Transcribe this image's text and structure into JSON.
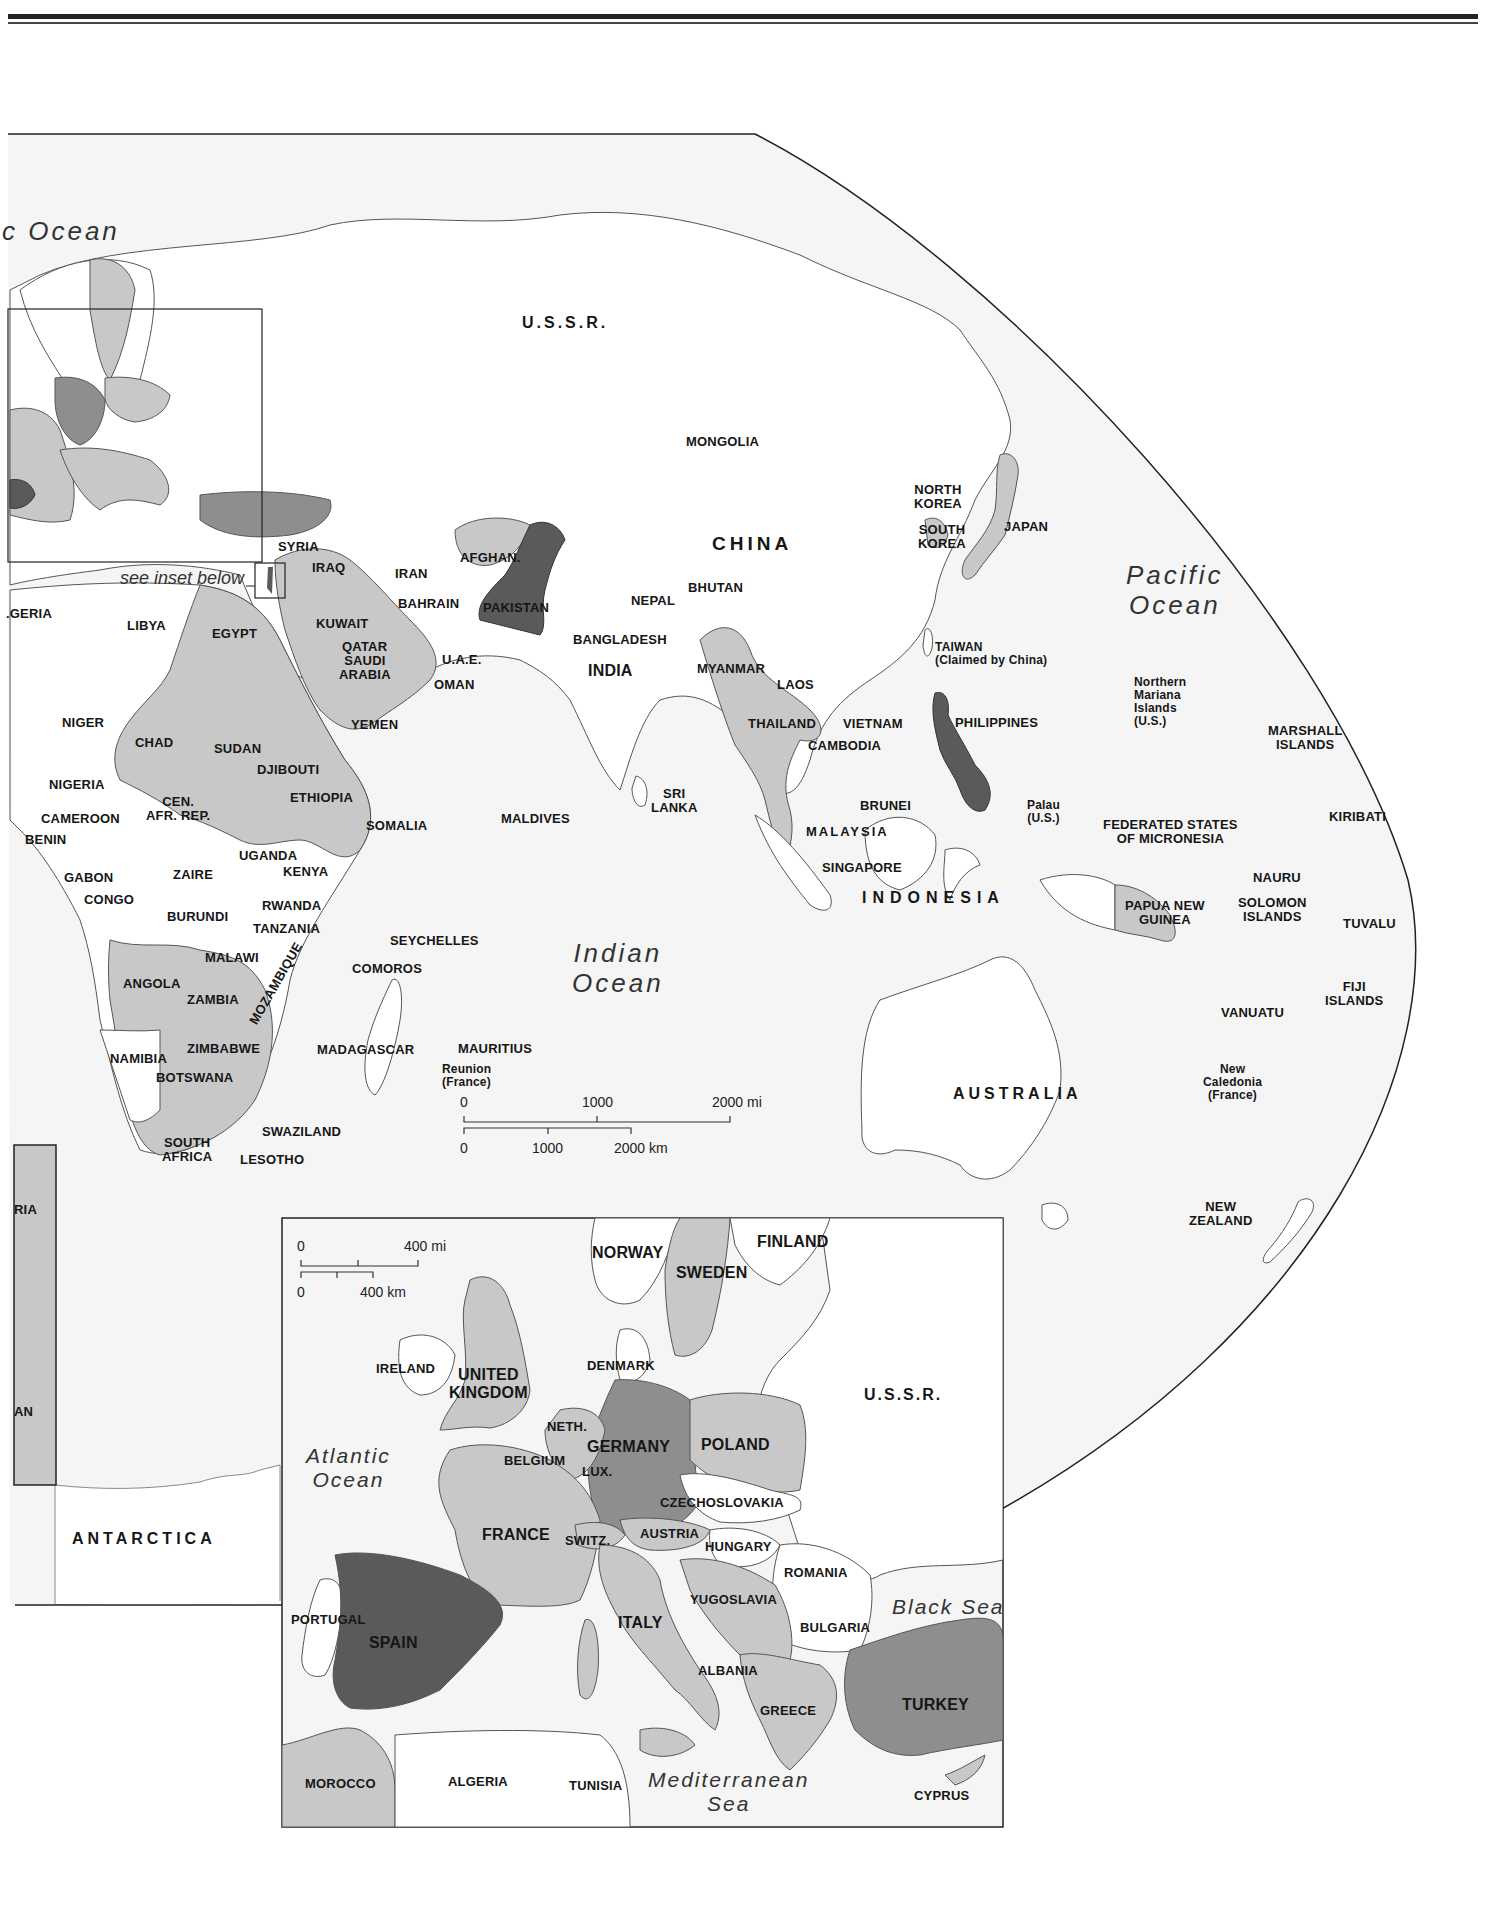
{
  "colors": {
    "ocean": "#f5f5f5",
    "land_none": "#ffffff",
    "land_light": "#c8c8c8",
    "land_medium": "#8e8e8e",
    "land_dark": "#5a5a5a",
    "border": "#555555",
    "frame": "#222222"
  },
  "main_map": {
    "oceans": [
      {
        "id": "arctic",
        "text": "c Ocean",
        "x": 2,
        "y": 216,
        "cls": "ocean"
      },
      {
        "id": "pacific",
        "text": "Pacific\nOcean",
        "x": 1126,
        "y": 560,
        "cls": "ocean"
      },
      {
        "id": "indian",
        "text": "Indian\nOcean",
        "x": 572,
        "y": 938,
        "cls": "ocean"
      }
    ],
    "annotations": [
      {
        "id": "see-inset",
        "text": "see inset below",
        "x": 120,
        "y": 578
      }
    ],
    "labels": [
      {
        "text": "U.S.S.R.",
        "x": 522,
        "y": 314,
        "cls": "med",
        "ls": 3
      },
      {
        "text": "MONGOLIA",
        "x": 686,
        "y": 435
      },
      {
        "text": "CHINA",
        "x": 712,
        "y": 534,
        "cls": "big"
      },
      {
        "text": "NORTH\nKOREA",
        "x": 914,
        "y": 483
      },
      {
        "text": "SOUTH\nKOREA",
        "x": 918,
        "y": 523
      },
      {
        "text": "JAPAN",
        "x": 1004,
        "y": 520
      },
      {
        "text": "SYRIA",
        "x": 278,
        "y": 540
      },
      {
        "text": "IRAQ",
        "x": 312,
        "y": 561
      },
      {
        "text": "IRAN",
        "x": 395,
        "y": 567
      },
      {
        "text": "AFGHAN.",
        "x": 460,
        "y": 551
      },
      {
        "text": "PAKISTAN",
        "x": 483,
        "y": 601
      },
      {
        "text": "BAHRAIN",
        "x": 398,
        "y": 597
      },
      {
        "text": "KUWAIT",
        "x": 316,
        "y": 617
      },
      {
        "text": "QATAR",
        "x": 342,
        "y": 640
      },
      {
        "text": "SAUDI\nARABIA",
        "x": 339,
        "y": 654
      },
      {
        "text": "U.A.E.",
        "x": 442,
        "y": 653
      },
      {
        "text": "OMAN",
        "x": 434,
        "y": 678
      },
      {
        "text": "YEMEN",
        "x": 351,
        "y": 718
      },
      {
        "text": "NEPAL",
        "x": 631,
        "y": 594
      },
      {
        "text": "BHUTAN",
        "x": 688,
        "y": 581
      },
      {
        "text": "BANGLADESH",
        "x": 573,
        "y": 633
      },
      {
        "text": "INDIA",
        "x": 588,
        "y": 662,
        "cls": "med"
      },
      {
        "text": "MYANMAR",
        "x": 697,
        "y": 662
      },
      {
        "text": "LAOS",
        "x": 777,
        "y": 678
      },
      {
        "text": "THAILAND",
        "x": 748,
        "y": 717
      },
      {
        "text": "VIETNAM",
        "x": 843,
        "y": 717
      },
      {
        "text": "CAMBODIA",
        "x": 808,
        "y": 739
      },
      {
        "text": "TAIWAN\n(Claimed by China)",
        "x": 935,
        "y": 641,
        "cls": "small left"
      },
      {
        "text": "PHILIPPINES",
        "x": 955,
        "y": 716
      },
      {
        "text": "Northern\nMariana\nIslands\n(U.S.)",
        "x": 1134,
        "y": 676,
        "cls": "small left"
      },
      {
        "text": "MARSHALL\nISLANDS",
        "x": 1268,
        "y": 724
      },
      {
        "text": "SRI\nLANKA",
        "x": 651,
        "y": 787
      },
      {
        "text": "MALDIVES",
        "x": 501,
        "y": 812
      },
      {
        "text": "BRUNEI",
        "x": 860,
        "y": 799
      },
      {
        "text": "MALAYSIA",
        "x": 806,
        "y": 825,
        "ls": 2
      },
      {
        "text": "SINGAPORE",
        "x": 822,
        "y": 861
      },
      {
        "text": "INDONESIA",
        "x": 862,
        "y": 889,
        "cls": "med",
        "ls": 6
      },
      {
        "text": "Palau\n(U.S.)",
        "x": 1027,
        "y": 799,
        "cls": "small"
      },
      {
        "text": "FEDERATED STATES\nOF MICRONESIA",
        "x": 1103,
        "y": 818
      },
      {
        "text": "KIRIBATI",
        "x": 1329,
        "y": 810
      },
      {
        "text": "NAURU",
        "x": 1253,
        "y": 871
      },
      {
        "text": "PAPUA NEW\nGUINEA",
        "x": 1125,
        "y": 899
      },
      {
        "text": "SOLOMON\nISLANDS",
        "x": 1238,
        "y": 896
      },
      {
        "text": "TUVALU",
        "x": 1343,
        "y": 917
      },
      {
        "text": "FIJI\nISLANDS",
        "x": 1325,
        "y": 980
      },
      {
        "text": "VANUATU",
        "x": 1221,
        "y": 1006
      },
      {
        "text": "New\nCaledonia\n(France)",
        "x": 1203,
        "y": 1063,
        "cls": "small"
      },
      {
        "text": "AUSTRALIA",
        "x": 953,
        "y": 1085,
        "cls": "med",
        "ls": 4
      },
      {
        "text": "NEW\nZEALAND",
        "x": 1189,
        "y": 1200
      },
      {
        "text": ".GERIA",
        "x": 6,
        "y": 607
      },
      {
        "text": "LIBYA",
        "x": 127,
        "y": 619
      },
      {
        "text": "EGYPT",
        "x": 212,
        "y": 627
      },
      {
        "text": "NIGER",
        "x": 62,
        "y": 716
      },
      {
        "text": "CHAD",
        "x": 135,
        "y": 736
      },
      {
        "text": "SUDAN",
        "x": 214,
        "y": 742
      },
      {
        "text": "DJIBOUTI",
        "x": 257,
        "y": 763
      },
      {
        "text": "NIGERIA",
        "x": 49,
        "y": 778
      },
      {
        "text": "ETHIOPIA",
        "x": 290,
        "y": 791
      },
      {
        "text": "CEN.\nAFR. REP.",
        "x": 146,
        "y": 795
      },
      {
        "text": "CAMEROON",
        "x": 41,
        "y": 812
      },
      {
        "text": "SOMALIA",
        "x": 366,
        "y": 819
      },
      {
        "text": "BENIN",
        "x": 25,
        "y": 833
      },
      {
        "text": "UGANDA",
        "x": 239,
        "y": 849
      },
      {
        "text": "KENYA",
        "x": 283,
        "y": 865
      },
      {
        "text": "GABON",
        "x": 64,
        "y": 871
      },
      {
        "text": "ZAIRE",
        "x": 173,
        "y": 868
      },
      {
        "text": "CONGO",
        "x": 84,
        "y": 893
      },
      {
        "text": "RWANDA",
        "x": 262,
        "y": 899
      },
      {
        "text": "BURUNDI",
        "x": 167,
        "y": 910
      },
      {
        "text": "TANZANIA",
        "x": 253,
        "y": 922
      },
      {
        "text": "SEYCHELLES",
        "x": 390,
        "y": 934
      },
      {
        "text": "MALAWI",
        "x": 205,
        "y": 951
      },
      {
        "text": "COMOROS",
        "x": 352,
        "y": 962
      },
      {
        "text": "ANGOLA",
        "x": 123,
        "y": 977
      },
      {
        "text": "ZAMBIA",
        "x": 187,
        "y": 993
      },
      {
        "text": "MOZAMBIQUE",
        "x": 247,
        "y": 1020,
        "rot": -60
      },
      {
        "text": "ZIMBABWE",
        "x": 187,
        "y": 1042
      },
      {
        "text": "MADAGASCAR",
        "x": 317,
        "y": 1043
      },
      {
        "text": "MAURITIUS",
        "x": 458,
        "y": 1042
      },
      {
        "text": "Reunion\n(France)",
        "x": 442,
        "y": 1063,
        "cls": "small left"
      },
      {
        "text": "NAMIBIA",
        "x": 110,
        "y": 1052
      },
      {
        "text": "BOTSWANA",
        "x": 156,
        "y": 1071
      },
      {
        "text": "SWAZILAND",
        "x": 262,
        "y": 1125
      },
      {
        "text": "SOUTH\nAFRICA",
        "x": 162,
        "y": 1136
      },
      {
        "text": "LESOTHO",
        "x": 240,
        "y": 1153
      },
      {
        "text": "RIA",
        "x": 14,
        "y": 1203
      },
      {
        "text": "AN",
        "x": 14,
        "y": 1405
      },
      {
        "text": "ANTARCTICA",
        "x": 72,
        "y": 1530,
        "cls": "med",
        "ls": 4
      }
    ],
    "scale_bar": {
      "miles": {
        "ticks": [
          "0",
          "1000",
          "2000 mi"
        ]
      },
      "km": {
        "ticks": [
          "0",
          "1000",
          "2000 km"
        ]
      }
    }
  },
  "europe_inset": {
    "oceans": [
      {
        "id": "atlantic",
        "text": "Atlantic\nOcean",
        "x": 306,
        "y": 1444,
        "cls": "ocean sm"
      },
      {
        "id": "mediterranean",
        "text": "Mediterranean\nSea",
        "x": 648,
        "y": 1768,
        "cls": "ocean sm"
      },
      {
        "id": "black-sea",
        "text": "Black Sea",
        "x": 892,
        "y": 1595,
        "cls": "ocean sm"
      }
    ],
    "labels": [
      {
        "text": "NORWAY",
        "x": 592,
        "y": 1244,
        "cls": "med"
      },
      {
        "text": "FINLAND",
        "x": 757,
        "y": 1233,
        "cls": "med"
      },
      {
        "text": "SWEDEN",
        "x": 676,
        "y": 1264,
        "cls": "med"
      },
      {
        "text": "IRELAND",
        "x": 376,
        "y": 1362
      },
      {
        "text": "UNITED\nKINGDOM",
        "x": 449,
        "y": 1366,
        "cls": "med"
      },
      {
        "text": "DENMARK",
        "x": 587,
        "y": 1359
      },
      {
        "text": "U.S.S.R.",
        "x": 864,
        "y": 1386,
        "cls": "med",
        "ls": 2
      },
      {
        "text": "NETH.",
        "x": 547,
        "y": 1420
      },
      {
        "text": "GERMANY",
        "x": 587,
        "y": 1438,
        "cls": "med"
      },
      {
        "text": "POLAND",
        "x": 701,
        "y": 1436,
        "cls": "med"
      },
      {
        "text": "BELGIUM",
        "x": 504,
        "y": 1454
      },
      {
        "text": "LUX.",
        "x": 582,
        "y": 1465
      },
      {
        "text": "CZECHOSLOVAKIA",
        "x": 660,
        "y": 1496
      },
      {
        "text": "FRANCE",
        "x": 482,
        "y": 1526,
        "cls": "med"
      },
      {
        "text": "SWITZ.",
        "x": 565,
        "y": 1534
      },
      {
        "text": "AUSTRIA",
        "x": 640,
        "y": 1527
      },
      {
        "text": "HUNGARY",
        "x": 705,
        "y": 1540
      },
      {
        "text": "ROMANIA",
        "x": 784,
        "y": 1566
      },
      {
        "text": "PORTUGAL",
        "x": 291,
        "y": 1613
      },
      {
        "text": "SPAIN",
        "x": 369,
        "y": 1634,
        "cls": "med"
      },
      {
        "text": "YUGOSLAVIA",
        "x": 690,
        "y": 1593
      },
      {
        "text": "ITALY",
        "x": 618,
        "y": 1614,
        "cls": "med"
      },
      {
        "text": "BULGARIA",
        "x": 800,
        "y": 1621
      },
      {
        "text": "ALBANIA",
        "x": 698,
        "y": 1664
      },
      {
        "text": "TURKEY",
        "x": 902,
        "y": 1696,
        "cls": "med"
      },
      {
        "text": "GREECE",
        "x": 760,
        "y": 1704
      },
      {
        "text": "MOROCCO",
        "x": 305,
        "y": 1777
      },
      {
        "text": "ALGERIA",
        "x": 448,
        "y": 1775
      },
      {
        "text": "TUNISIA",
        "x": 569,
        "y": 1779
      },
      {
        "text": "CYPRUS",
        "x": 914,
        "y": 1789
      }
    ],
    "scale_bar": {
      "miles": {
        "ticks": [
          "0",
          "400 mi"
        ]
      },
      "km": {
        "ticks": [
          "0",
          "400 km"
        ]
      }
    }
  }
}
